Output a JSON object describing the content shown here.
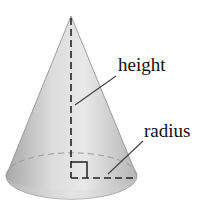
{
  "diagram": {
    "labels": {
      "height": "height",
      "radius": "radius"
    },
    "colors": {
      "cone_fill_light": "#e6e6e6",
      "cone_fill_dark": "#a9a9a9",
      "line": "#222222",
      "background": "#ffffff"
    }
  }
}
